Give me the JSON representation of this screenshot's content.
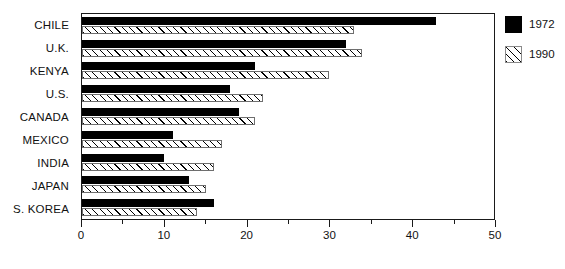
{
  "chart_data": {
    "type": "bar",
    "orientation": "horizontal",
    "title": "",
    "subtitle": "",
    "xlabel": "",
    "ylabel": "",
    "categories": [
      "CHILE",
      "U.K.",
      "KENYA",
      "U.S.",
      "CANADA",
      "MEXICO",
      "INDIA",
      "JAPAN",
      "S. KOREA"
    ],
    "series": [
      {
        "name": "1972",
        "color": "#000000",
        "fill": "solid-black",
        "values": [
          43,
          32,
          21,
          18,
          19,
          11,
          10,
          13,
          16
        ]
      },
      {
        "name": "1990",
        "color": "#ffffff",
        "fill": "diagonal-hatch",
        "values": [
          33,
          34,
          30,
          22,
          21,
          17,
          16,
          15,
          14
        ]
      }
    ],
    "xlim": [
      0,
      50
    ],
    "xticks": [
      0,
      10,
      20,
      30,
      40,
      50
    ],
    "xtick_labels": [
      "0",
      "10",
      "20",
      "30",
      "40",
      "50"
    ],
    "minor_xticks": [
      5,
      15,
      25,
      35,
      45
    ],
    "grid": false,
    "legend_position": "right-top",
    "frame": true
  },
  "legend": {
    "entries": [
      {
        "label": "1972",
        "swatch": "solid-black-swatch"
      },
      {
        "label": "1990",
        "swatch": "hatched-swatch"
      }
    ]
  },
  "colors": {
    "bar_1972": "#000000",
    "bar_1990_fill": "#ffffff",
    "bar_1990_hatch": "#000000",
    "axis": "#1a1a1a",
    "text": "#111111",
    "background": "#ffffff"
  }
}
